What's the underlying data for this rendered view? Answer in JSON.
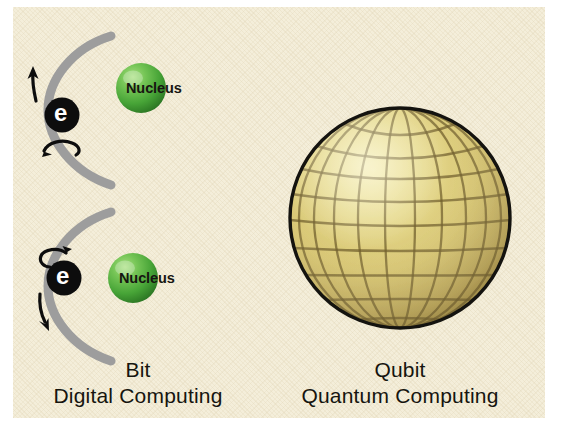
{
  "figure": {
    "background_color": "#f4eeda",
    "page_color": "#ffffff"
  },
  "panels": [
    {
      "id": "bit",
      "caption_title": "Bit",
      "caption_subtitle": "Digital Computing",
      "atoms": [
        {
          "id": "atom-spin-up",
          "electron_label": "e",
          "nucleus_label": "Nucleus",
          "spin_direction": "up",
          "arrow_direction": "up",
          "spin_arrow_position": "below-electron"
        },
        {
          "id": "atom-spin-down",
          "electron_label": "e",
          "nucleus_label": "Nucleus",
          "spin_direction": "down",
          "arrow_direction": "down",
          "spin_arrow_position": "above-electron"
        }
      ]
    },
    {
      "id": "qubit",
      "caption_title": "Qubit",
      "caption_subtitle": "Quantum Computing",
      "sphere": {
        "id": "bloch-sphere",
        "style": "wireframe-globe",
        "meridians": 12,
        "parallels": 9,
        "fill_color": "#d8c775",
        "highlight_color": "#efe49f",
        "shadow_color": "#b39d4e",
        "grid_color": "#6a5a2a",
        "outline_color": "#1a1a16"
      }
    }
  ],
  "colors": {
    "paper": "#f4eeda",
    "orbit_arc": "#9a9a9a",
    "electron_fill": "#0d0d0d",
    "electron_text": "#ffffff",
    "nucleus_green_light": "#8fd46a",
    "nucleus_green_mid": "#4eaa3c",
    "nucleus_green_dark": "#2e7a26",
    "sphere_gold": "#d8c775",
    "text": "#16150f",
    "arrow": "#0d0d0d"
  }
}
